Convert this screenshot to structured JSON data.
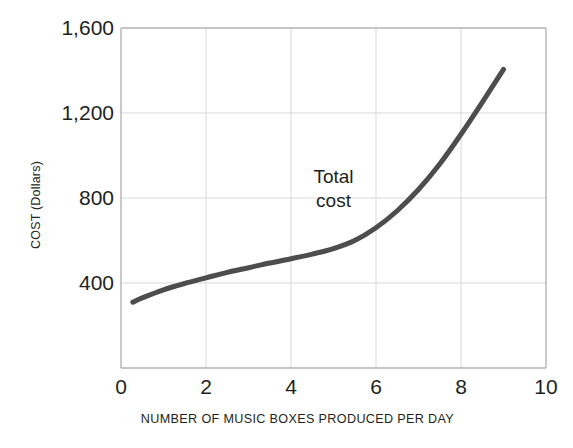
{
  "chart_data": {
    "type": "line",
    "title": "",
    "subtitle": "",
    "xlabel": "NUMBER OF MUSIC BOXES PRODUCED PER DAY",
    "ylabel": "COST (Dollars)",
    "xlim": [
      0,
      10
    ],
    "ylim": [
      0,
      1600
    ],
    "xticks": [
      "0",
      "2",
      "4",
      "6",
      "8",
      "10"
    ],
    "xtick_values": [
      0,
      2,
      4,
      6,
      8,
      10
    ],
    "yticks": [
      "400",
      "800",
      "1,200",
      "1,600"
    ],
    "ytick_values": [
      400,
      800,
      1200,
      1600
    ],
    "grid": true,
    "grid_color": "#d9d9d9",
    "axis_color": "#b3b3b3",
    "legend": "none",
    "series": [
      {
        "name": "Total cost",
        "color": "#4d4d4d",
        "line_width": 5,
        "annotation": {
          "line1": "Total",
          "line2": "cost",
          "x": 5.0,
          "y": 900
        },
        "x": [
          0.28,
          0.5,
          1.0,
          1.5,
          2.0,
          2.5,
          3.0,
          3.5,
          4.0,
          4.5,
          5.0,
          5.5,
          6.0,
          6.5,
          7.0,
          7.5,
          8.0,
          8.5,
          9.0
        ],
        "y": [
          310,
          330,
          368,
          398,
          424,
          450,
          472,
          494,
          514,
          536,
          562,
          600,
          660,
          740,
          840,
          960,
          1100,
          1250,
          1405
        ]
      }
    ]
  },
  "geometry": {
    "plot_left": 121,
    "plot_right": 546,
    "plot_top": 28,
    "plot_bottom": 368
  }
}
